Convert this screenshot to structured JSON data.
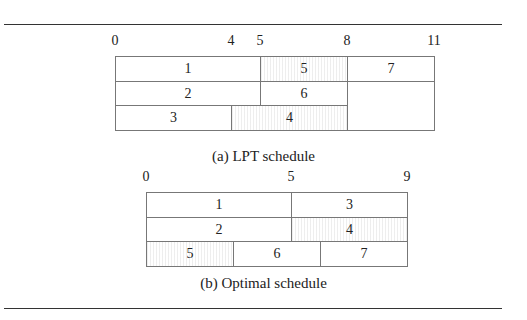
{
  "figure": {
    "lpt": {
      "caption": "(a) LPT schedule",
      "makespan": 11,
      "ticks": [
        {
          "value": 0,
          "label": "0"
        },
        {
          "value": 4,
          "label": "4"
        },
        {
          "value": 5,
          "label": "5"
        },
        {
          "value": 8,
          "label": "8"
        },
        {
          "value": 11,
          "label": "11"
        }
      ],
      "machines": [
        [
          {
            "job": "1",
            "start": 0,
            "end": 5,
            "hatched": false
          },
          {
            "job": "5",
            "start": 5,
            "end": 8,
            "hatched": true
          },
          {
            "job": "7",
            "start": 8,
            "end": 11,
            "hatched": false
          }
        ],
        [
          {
            "job": "2",
            "start": 0,
            "end": 5,
            "hatched": false
          },
          {
            "job": "6",
            "start": 5,
            "end": 8,
            "hatched": false
          }
        ],
        [
          {
            "job": "3",
            "start": 0,
            "end": 4,
            "hatched": false
          },
          {
            "job": "4",
            "start": 4,
            "end": 8,
            "hatched": true
          }
        ]
      ]
    },
    "optimal": {
      "caption": "(b) Optimal schedule",
      "makespan": 9,
      "ticks": [
        {
          "value": 0,
          "label": "0"
        },
        {
          "value": 5,
          "label": "5"
        },
        {
          "value": 9,
          "label": "9"
        }
      ],
      "machines": [
        [
          {
            "job": "1",
            "start": 0,
            "end": 5,
            "hatched": false
          },
          {
            "job": "3",
            "start": 5,
            "end": 9,
            "hatched": false
          }
        ],
        [
          {
            "job": "2",
            "start": 0,
            "end": 5,
            "hatched": false
          },
          {
            "job": "4",
            "start": 5,
            "end": 9,
            "hatched": true
          }
        ],
        [
          {
            "job": "5",
            "start": 0,
            "end": 3,
            "hatched": true
          },
          {
            "job": "6",
            "start": 3,
            "end": 6,
            "hatched": false
          },
          {
            "job": "7",
            "start": 6,
            "end": 9,
            "hatched": false
          }
        ]
      ]
    }
  }
}
